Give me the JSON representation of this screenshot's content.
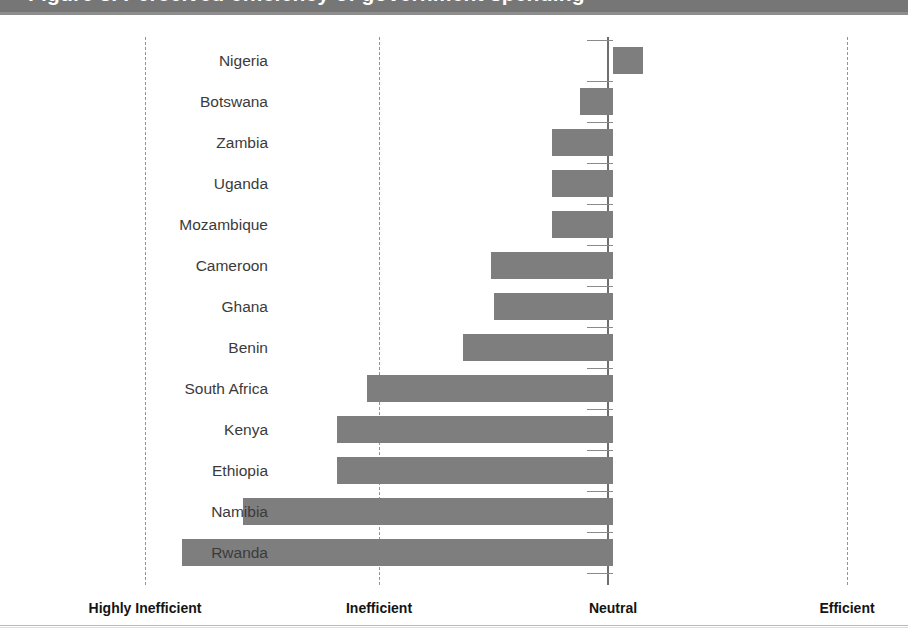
{
  "header": {
    "clipped_title": "Figure 3. Perceived efficiency of government spending",
    "band_color": "#767676"
  },
  "colors": {
    "bar": "#7e7e7e",
    "gridline": "#949494",
    "axis": "#6f6f6f",
    "label_text": "#3b3b3b",
    "axis_label_text": "#141414"
  },
  "chart_data": {
    "type": "bar",
    "orientation": "horizontal",
    "title": "",
    "xlabel": "",
    "ylabel": "",
    "grid": true,
    "legend": false,
    "xlim": [
      -2,
      1
    ],
    "xtick_values": [
      -2,
      -1,
      0,
      1
    ],
    "xtick_labels": [
      "Highly Inefficient",
      "Inefficient",
      "Neutral",
      "Efficient"
    ],
    "categories": [
      "Nigeria",
      "Botswana",
      "Zambia",
      "Uganda",
      "Mozambique",
      "Cameroon",
      "Ghana",
      "Benin",
      "South Africa",
      "Kenya",
      "Ethiopia",
      "Namibia",
      "Rwanda"
    ],
    "values": [
      0.13,
      -0.14,
      -0.26,
      -0.26,
      -0.26,
      -0.52,
      -0.51,
      -0.64,
      -1.05,
      -1.18,
      -1.18,
      -1.58,
      -1.84
    ],
    "value_unit": "index",
    "zero_line": 0
  },
  "axis_labels": [
    {
      "text": "Highly Inefficient",
      "value": -2
    },
    {
      "text": "Inefficient",
      "value": -1
    },
    {
      "text": "Neutral",
      "value": 0
    },
    {
      "text": "Efficient",
      "value": 1
    }
  ],
  "bars": [
    {
      "label": "Nigeria",
      "value": 0.13
    },
    {
      "label": "Botswana",
      "value": -0.14
    },
    {
      "label": "Zambia",
      "value": -0.26
    },
    {
      "label": "Uganda",
      "value": -0.26
    },
    {
      "label": "Mozambique",
      "value": -0.26
    },
    {
      "label": "Cameroon",
      "value": -0.52
    },
    {
      "label": "Ghana",
      "value": -0.51
    },
    {
      "label": "Benin",
      "value": -0.64
    },
    {
      "label": "South Africa",
      "value": -1.05
    },
    {
      "label": "Kenya",
      "value": -1.18
    },
    {
      "label": "Ethiopia",
      "value": -1.18
    },
    {
      "label": "Namibia",
      "value": -1.58
    },
    {
      "label": "Rwanda",
      "value": -1.84
    }
  ]
}
